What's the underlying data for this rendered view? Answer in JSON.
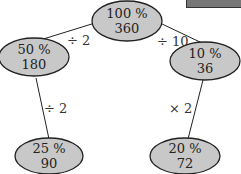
{
  "diagram": {
    "type": "percentage-tree",
    "fill_color": "#c8c8c8",
    "stroke_color": "#222222",
    "nodes": [
      {
        "id": "root",
        "percent": "100 %",
        "value": "360"
      },
      {
        "id": "left",
        "percent": "50 %",
        "value": "180"
      },
      {
        "id": "right",
        "percent": "10 %",
        "value": "36"
      },
      {
        "id": "left-child",
        "percent": "25 %",
        "value": "90"
      },
      {
        "id": "right-child",
        "percent": "20 %",
        "value": "72"
      }
    ],
    "edges": [
      {
        "from": "root",
        "to": "left",
        "label": "÷ 2"
      },
      {
        "from": "root",
        "to": "right",
        "label": "÷ 10"
      },
      {
        "from": "left",
        "to": "left-child",
        "label": "÷ 2"
      },
      {
        "from": "right",
        "to": "right-child",
        "label": "× 2"
      }
    ]
  }
}
